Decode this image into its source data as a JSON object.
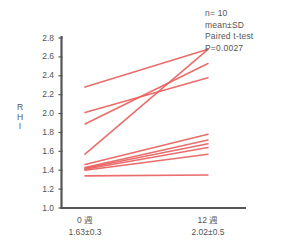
{
  "chart_data": {
    "type": "line",
    "title": "",
    "subtitle": "",
    "xlabel": "",
    "ylabel": "RHI",
    "ylim": [
      1.0,
      2.8
    ],
    "yticks": [
      "2.8",
      "2.6",
      "2.4",
      "2.2",
      "2.0",
      "1.8",
      "1.6",
      "1.4",
      "1.2",
      "1.0"
    ],
    "ytick_values": [
      2.8,
      2.6,
      2.4,
      2.2,
      2.0,
      1.8,
      1.6,
      1.4,
      1.2,
      1.0
    ],
    "grid": false,
    "legend": "none",
    "categories": [
      "0 週",
      "12 週"
    ],
    "category_summaries": [
      "1.63±0.3",
      "2.02±0.5"
    ],
    "series": [
      {
        "name": "subject-1",
        "values": [
          2.28,
          2.68
        ]
      },
      {
        "name": "subject-2",
        "values": [
          2.01,
          2.38
        ]
      },
      {
        "name": "subject-3",
        "values": [
          1.89,
          2.53
        ]
      },
      {
        "name": "subject-4",
        "values": [
          1.57,
          2.68
        ]
      },
      {
        "name": "subject-5",
        "values": [
          1.46,
          1.78
        ]
      },
      {
        "name": "subject-6",
        "values": [
          1.43,
          1.72
        ]
      },
      {
        "name": "subject-7",
        "values": [
          1.42,
          1.68
        ]
      },
      {
        "name": "subject-8",
        "values": [
          1.41,
          1.64
        ]
      },
      {
        "name": "subject-9",
        "values": [
          1.4,
          1.57
        ]
      },
      {
        "name": "subject-10",
        "values": [
          1.34,
          1.35
        ]
      }
    ],
    "annotations": [
      "n= 10",
      "mean±SD",
      "Paired t-test",
      "P=0.0027"
    ],
    "line_color": "#e8615f",
    "axis_color": "#555555"
  },
  "stats": {
    "n_label": "n= 10",
    "mean_sd_label": "mean±SD",
    "test_label": "Paired t-test",
    "pvalue_label": "P=0.0027"
  },
  "axes": {
    "y_title_chars": [
      "R",
      "H",
      "I"
    ],
    "y_tick_labels": [
      "2.8",
      "2.6",
      "2.4",
      "2.2",
      "2.0",
      "1.8",
      "1.6",
      "1.4",
      "1.2",
      "1.0"
    ],
    "x_categories": [
      {
        "label": "0 週",
        "summary": "1.63±0.3"
      },
      {
        "label": "12 週",
        "summary": "2.02±0.5"
      }
    ]
  }
}
